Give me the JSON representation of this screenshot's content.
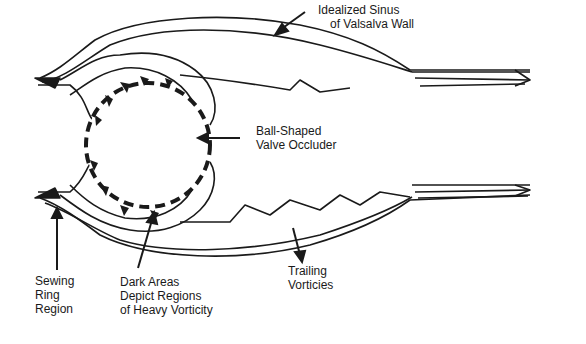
{
  "diagram": {
    "labels": {
      "sinus_wall": [
        "Idealized Sinus",
        "of Valsalva Wall"
      ],
      "occluder": [
        "Ball-Shaped",
        "Valve Occluder"
      ],
      "sewing_ring": [
        "Sewing",
        "Ring",
        "Region"
      ],
      "dark_areas": [
        "Dark Areas",
        "Depict Regions",
        "of Heavy Vorticity"
      ],
      "trailing": [
        "Trailing",
        "Vorticies"
      ]
    },
    "colors": {
      "ink": "#1a1a1a",
      "background": "#ffffff"
    }
  }
}
